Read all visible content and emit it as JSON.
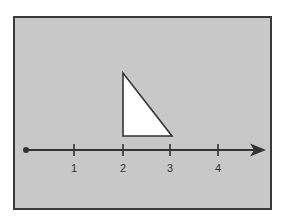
{
  "diagram": {
    "type": "number-line-with-triangle",
    "colors": {
      "background": "#c8c8c8",
      "frame": "#3a3a3a",
      "line": "#333333",
      "triangle_fill": "#ffffff",
      "triangle_stroke": "#333333"
    },
    "number_line": {
      "start_value": 0,
      "ticks": [
        {
          "value": 1,
          "label": "1"
        },
        {
          "value": 2,
          "label": "2"
        },
        {
          "value": 3,
          "label": "3"
        },
        {
          "value": 4,
          "label": "4"
        }
      ],
      "has_start_dot": true,
      "has_arrow": true
    },
    "triangle": {
      "type": "right-triangle",
      "vertices": [
        {
          "x": 2,
          "y": 1.3
        },
        {
          "x": 2,
          "y": 0.3
        },
        {
          "x": 3,
          "y": 0.3
        }
      ]
    }
  }
}
